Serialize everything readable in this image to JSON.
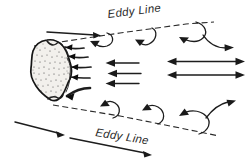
{
  "figure": {
    "type": "river-hydraulics-schematic",
    "width": 249,
    "height": 164,
    "background_color": "#ffffff",
    "ink_color": "#1a1a1a"
  },
  "labels": {
    "eddy_line_top": "Eddy Line",
    "eddy_line_bottom": "Eddy Line"
  },
  "obstruction": {
    "name": "rock",
    "fill_color": "#f2f0ec",
    "outline_color": "#151515",
    "texture": "stipple",
    "center_x": 51,
    "center_y": 70,
    "width": 42,
    "height": 60
  },
  "eddy_lines": [
    {
      "name": "upper-eddy-line",
      "style": "dashed",
      "from": [
        34,
        45
      ],
      "to": [
        218,
        23
      ]
    },
    {
      "name": "lower-eddy-line",
      "style": "dashed",
      "from": [
        52,
        104
      ],
      "to": [
        222,
        135
      ]
    }
  ],
  "flow_arrows": {
    "main_current_upstream_top": {
      "name": "main-current-arrow-upper-left",
      "direction": "right",
      "from": [
        47,
        32
      ],
      "to": [
        101,
        36
      ]
    },
    "main_current_upstream_bottom": [
      {
        "name": "main-current-arrow-lower-left-1",
        "direction": "down-right",
        "from": [
          15,
          122
        ],
        "to": [
          65,
          136
        ]
      },
      {
        "name": "main-current-arrow-lower-left-2",
        "direction": "down-right",
        "from": [
          70,
          138
        ],
        "to": [
          152,
          155
        ]
      }
    ],
    "reverse_flow_center": [
      {
        "name": "eddy-reverse-arrow-1",
        "direction": "left",
        "from": [
          138,
          64
        ],
        "to": [
          106,
          64
        ]
      },
      {
        "name": "eddy-reverse-arrow-2",
        "direction": "left",
        "from": [
          140,
          74
        ],
        "to": [
          108,
          74
        ]
      },
      {
        "name": "eddy-reverse-arrow-3",
        "direction": "left",
        "from": [
          138,
          83
        ],
        "to": [
          106,
          83
        ]
      }
    ],
    "downstream_double_arrows": [
      {
        "name": "downstream-arrow-upper",
        "direction": "bidirectional",
        "from": [
          172,
          62
        ],
        "to": [
          243,
          62
        ]
      },
      {
        "name": "downstream-arrow-lower",
        "direction": "bidirectional",
        "from": [
          172,
          75
        ],
        "to": [
          243,
          75
        ]
      }
    ],
    "rock_wake_arrows": [
      {
        "name": "rock-wake-arrow-1",
        "direction": "left-into-rock"
      },
      {
        "name": "rock-wake-arrow-2",
        "direction": "left-into-rock"
      },
      {
        "name": "rock-wake-arrow-3",
        "direction": "left-into-rock"
      },
      {
        "name": "rock-wake-arrow-4",
        "direction": "left-into-rock"
      },
      {
        "name": "rock-wake-arrow-5",
        "direction": "down-left-into-rock"
      }
    ],
    "recirculation_hooks_top": [
      {
        "name": "recirculation-hook-top-1",
        "direction": "down-left"
      },
      {
        "name": "recirculation-hook-top-2",
        "direction": "down-left"
      }
    ],
    "recirculation_hooks_bottom": [
      {
        "name": "recirculation-hook-bottom-1",
        "direction": "up-left"
      },
      {
        "name": "recirculation-hook-bottom-2",
        "direction": "up-left"
      }
    ],
    "large_recirculation_top": {
      "name": "large-recirculation-curve-top",
      "direction": "counter-clockwise-loop"
    },
    "large_recirculation_bottom": {
      "name": "large-recirculation-curve-bottom",
      "direction": "clockwise-loop"
    }
  }
}
